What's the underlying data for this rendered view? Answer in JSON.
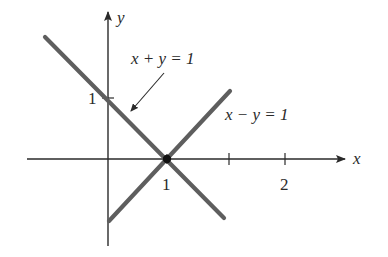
{
  "figure": {
    "axes": {
      "x_label": "x",
      "y_label": "y"
    },
    "ticks": {
      "x_ticks": [
        {
          "label": "1",
          "px": 167
        },
        {
          "label": "",
          "px": 229
        },
        {
          "label": "2",
          "px": 285
        }
      ],
      "y_ticks": [
        {
          "label": "1",
          "py": 98
        }
      ]
    },
    "lines": [
      {
        "name": "x + y = 1",
        "label": "x + y = 1",
        "color": "#5a5a5a"
      },
      {
        "name": "x − y = 1",
        "label": "x − y = 1",
        "color": "#5a5a5a"
      }
    ],
    "intersection_point": {
      "x": 1,
      "y": 0
    },
    "labels": {
      "x_tick_1": "1",
      "x_tick_2": "2",
      "y_tick_1": "1",
      "line_a_label": "x + y = 1",
      "line_b_label": "x − y = 1"
    },
    "colors": {
      "axis": "#2a2a2a",
      "line": "#5e5e5e",
      "text": "#2a2a2a",
      "background": "#ffffff"
    }
  }
}
